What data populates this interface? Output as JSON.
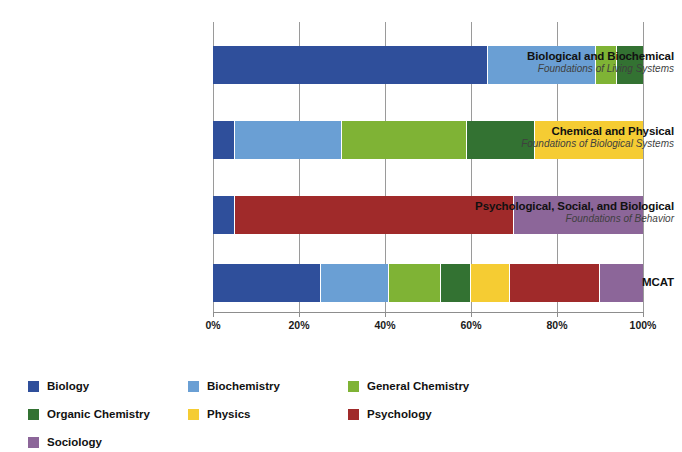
{
  "chart_data": {
    "type": "bar",
    "orientation": "horizontal",
    "stacked": true,
    "normalized": true,
    "title": "",
    "subtitle": "",
    "xlabel": "",
    "ylabel": "",
    "xlim": [
      0,
      100
    ],
    "xticks": [
      0,
      20,
      40,
      60,
      80,
      100
    ],
    "xticklabels": [
      "0%",
      "20%",
      "40%",
      "60%",
      "80%",
      "100%"
    ],
    "grid": true,
    "legend_position": "bottom",
    "categories": [
      "Biological and Biochemical Foundations of Living Systems",
      "Chemical and Physical Foundations of Biological Systems",
      "Psychological, Social, and Biological Foundations of Behavior",
      "MCAT"
    ],
    "category_labels": [
      {
        "line1": "Biological and Biochemical",
        "line2": "Foundations of Living Systems"
      },
      {
        "line1": "Chemical and Physical",
        "line2": "Foundations of Biological Systems"
      },
      {
        "line1": "Psychological, Social, and Biological",
        "line2": "Foundations of Behavior"
      },
      {
        "line1": "MCAT",
        "line2": ""
      }
    ],
    "series": [
      {
        "name": "Biology",
        "color": "#2f4f9b",
        "values": [
          64,
          5,
          5,
          25
        ]
      },
      {
        "name": "Biochemistry",
        "color": "#6a9fd4",
        "values": [
          25,
          25,
          0,
          16
        ]
      },
      {
        "name": "General Chemistry",
        "color": "#7fb335",
        "values": [
          5,
          29,
          0,
          12
        ]
      },
      {
        "name": "Organic Chemistry",
        "color": "#337232",
        "values": [
          6,
          16,
          0,
          7
        ]
      },
      {
        "name": "Physics",
        "color": "#f5cc33",
        "values": [
          0,
          25,
          0,
          9
        ]
      },
      {
        "name": "Psychology",
        "color": "#a02a2a",
        "values": [
          0,
          0,
          65,
          21
        ]
      },
      {
        "name": "Sociology",
        "color": "#8c6699",
        "values": [
          0,
          0,
          30,
          10
        ]
      }
    ]
  },
  "legend": {
    "items": [
      {
        "label": "Biology",
        "color": "#2f4f9b"
      },
      {
        "label": "Biochemistry",
        "color": "#6a9fd4"
      },
      {
        "label": "General Chemistry",
        "color": "#7fb335"
      },
      {
        "label": "Organic Chemistry",
        "color": "#337232"
      },
      {
        "label": "Physics",
        "color": "#f5cc33"
      },
      {
        "label": "Psychology",
        "color": "#a02a2a"
      },
      {
        "label": "Sociology",
        "color": "#8c6699"
      }
    ]
  },
  "axis": {
    "gridline_color": "#9a9a9a",
    "baseline_color": "#8d8d8d"
  }
}
